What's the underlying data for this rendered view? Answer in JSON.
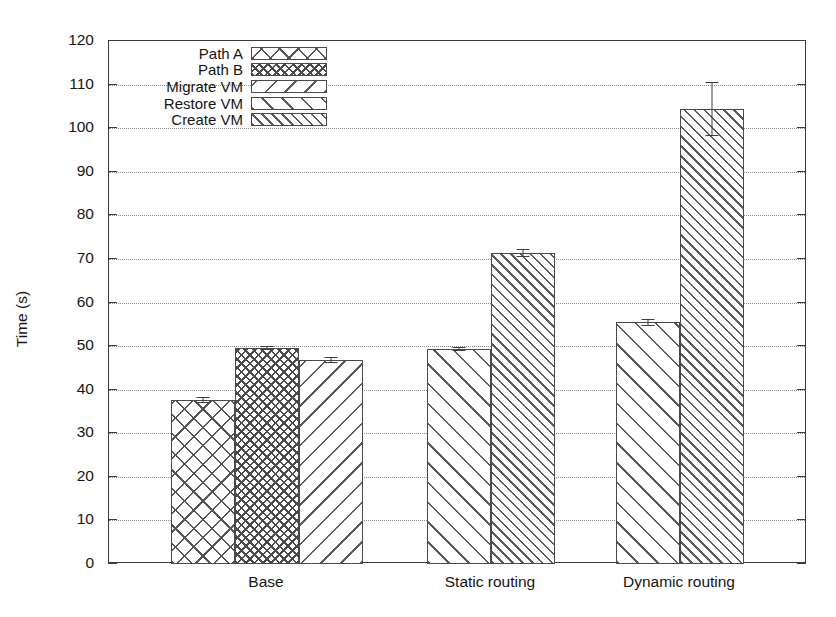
{
  "chart_data": {
    "type": "bar",
    "title": "",
    "xlabel": "",
    "ylabel": "Time (s)",
    "ylim": [
      0,
      120
    ],
    "ytick_step": 10,
    "yticks": [
      0,
      10,
      20,
      30,
      40,
      50,
      60,
      70,
      80,
      90,
      100,
      110,
      120
    ],
    "grid": true,
    "grid_axis": "y",
    "legend_position": "upper-left",
    "categories": [
      "Base",
      "Static routing",
      "Dynamic routing"
    ],
    "series": [
      {
        "name": "Path A",
        "pattern": "cross-x",
        "values": [
          37.7,
          null,
          null
        ],
        "errors": [
          0.7,
          null,
          null
        ]
      },
      {
        "name": "Path B",
        "pattern": "cross-dense",
        "values": [
          49.6,
          null,
          null
        ],
        "errors": [
          0.5,
          null,
          null
        ]
      },
      {
        "name": "Migrate VM",
        "pattern": "backslash",
        "values": [
          46.8,
          null,
          null
        ],
        "errors": [
          0.6,
          null,
          null
        ]
      },
      {
        "name": "Restore VM",
        "pattern": "slash",
        "values": [
          null,
          49.4,
          55.5
        ],
        "errors": [
          null,
          0.5,
          0.8
        ]
      },
      {
        "name": "Create VM",
        "pattern": "slash-dense",
        "values": [
          null,
          71.4,
          104.5
        ],
        "errors": [
          null,
          0.9,
          6.2
        ]
      }
    ],
    "bars": [
      {
        "group": "Base",
        "series": "Path A",
        "value": 37.7,
        "err_low": 37.0,
        "err_high": 38.4
      },
      {
        "group": "Base",
        "series": "Path B",
        "value": 49.6,
        "err_low": 49.1,
        "err_high": 50.1
      },
      {
        "group": "Base",
        "series": "Migrate VM",
        "value": 46.8,
        "err_low": 46.2,
        "err_high": 47.4
      },
      {
        "group": "Static routing",
        "series": "Restore VM",
        "value": 49.4,
        "err_low": 48.9,
        "err_high": 49.9
      },
      {
        "group": "Static routing",
        "series": "Create VM",
        "value": 71.4,
        "err_low": 70.5,
        "err_high": 72.3
      },
      {
        "group": "Dynamic routing",
        "series": "Restore VM",
        "value": 55.5,
        "err_low": 54.7,
        "err_high": 56.3
      },
      {
        "group": "Dynamic routing",
        "series": "Create VM",
        "value": 104.5,
        "err_low": 98.3,
        "err_high": 110.7
      }
    ]
  },
  "legend": {
    "items": [
      {
        "label": "Path A"
      },
      {
        "label": "Path B"
      },
      {
        "label": "Migrate VM"
      },
      {
        "label": "Restore VM"
      },
      {
        "label": "Create VM"
      }
    ]
  },
  "axes": {
    "y_label": "Time (s)",
    "y_ticks": [
      "0",
      "10",
      "20",
      "30",
      "40",
      "50",
      "60",
      "70",
      "80",
      "90",
      "100",
      "110",
      "120"
    ],
    "x_ticks": [
      "Base",
      "Static routing",
      "Dynamic routing"
    ]
  }
}
